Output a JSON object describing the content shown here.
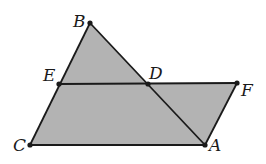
{
  "diagram": {
    "fill_color": "#b3b3b3",
    "stroke_color": "#1a1a1a",
    "points": {
      "B": {
        "label": "B",
        "x": 90,
        "y": 23
      },
      "E": {
        "label": "E",
        "x": 59,
        "y": 84
      },
      "D": {
        "label": "D",
        "x": 148,
        "y": 84
      },
      "F": {
        "label": "F",
        "x": 237,
        "y": 83
      },
      "C": {
        "label": "C",
        "x": 30,
        "y": 145
      },
      "A": {
        "label": "A",
        "x": 205,
        "y": 145
      }
    },
    "segments": [
      "BC",
      "BA",
      "EF",
      "CA",
      "FA"
    ],
    "shaded_regions": [
      "triangle BCA",
      "parallelogram DFAC portion"
    ]
  }
}
